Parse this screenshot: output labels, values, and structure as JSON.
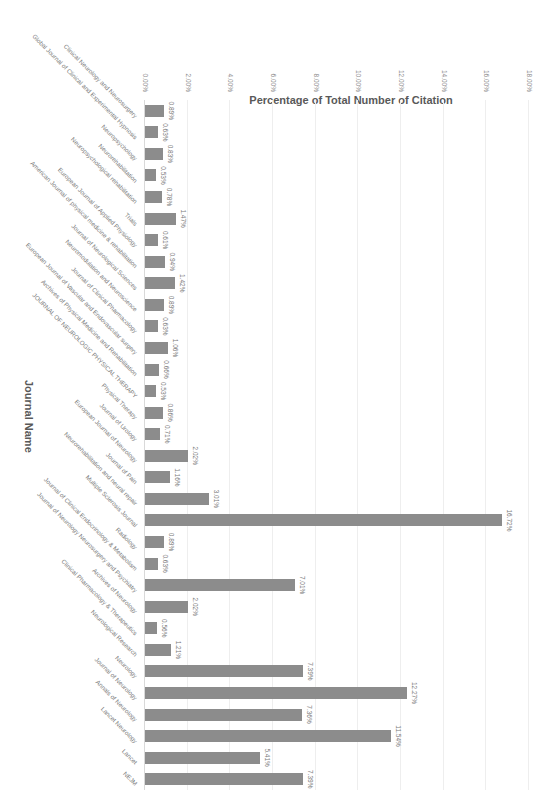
{
  "chart_data": {
    "type": "bar",
    "title": "",
    "xlabel": "Journal Name",
    "ylabel": "Percentage of Total Number of Citation",
    "ylim": [
      0,
      18
    ],
    "yticks": [
      "0.00%",
      "2.00%",
      "4.00%",
      "6.00%",
      "8.00%",
      "10.00%",
      "12.00%",
      "14.00%",
      "16.00%",
      "18.00%"
    ],
    "grid": true,
    "legend": null,
    "orientation_in_image": "rotated 90 degrees clockwise",
    "bar_color": "#8c8c8c",
    "categories": [
      "Clinical Neurology and Neurosurgery",
      "Global Journal of Clinical and Experimental Hypnosis",
      "Neuropsychology",
      "Neurorehabilitation",
      "Neuropsychological rehabilitation",
      "Trials",
      "European Journal of Applied Physiology",
      "American Journal of physical medicine & rehabilitation",
      "Journal of Neurological Sciences",
      "Neuromodulation and Neuroscience",
      "Journal of Clinical Pharmacology",
      "European Journal of Vascular and Endovascular surgery",
      "Archives of Physical Medicine and Rehabilitation",
      "JOURNAL OF NEUROLOGIC PHYSICAL THERAPY",
      "Physical Therapy",
      "Journal of Urology",
      "European Journal of Neurology",
      "Journal of Pain",
      "Neurorehabilitation and neural repair",
      "Multiple Sclerosis Journal",
      "Radiology",
      "Journal of Clinical Endocrinology & Metabolism",
      "Journal of Neurology Neurosurgery and Psychiatry",
      "Archives of Neurology",
      "Clinical Pharmacology & Therapeutics",
      "Neurological Research",
      "Neurology",
      "Journal of Neurology",
      "Annals of Neurology",
      "Lancet Neurology",
      "Lancet",
      "NEJM"
    ],
    "values": [
      0.89,
      0.63,
      0.83,
      0.53,
      0.78,
      1.47,
      0.61,
      0.94,
      1.42,
      0.89,
      0.63,
      1.06,
      0.66,
      0.53,
      0.86,
      0.71,
      2.02,
      1.16,
      3.01,
      16.72,
      0.89,
      0.63,
      7.01,
      2.02,
      0.56,
      1.21,
      7.39,
      12.27,
      7.36,
      11.54,
      5.41,
      7.39
    ],
    "value_labels": [
      "0.89%",
      "0.63%",
      "0.83%",
      "0.53%",
      "0.78%",
      "1.47%",
      "0.61%",
      "0.94%",
      "1.42%",
      "0.89%",
      "0.63%",
      "1.06%",
      "0.66%",
      "0.53%",
      "0.86%",
      "0.71%",
      "2.02%",
      "1.16%",
      "3.01%",
      "16.72%",
      "0.89%",
      "0.63%",
      "7.01%",
      "2.02%",
      "0.56%",
      "1.21%",
      "7.39%",
      "12.27%",
      "7.36%",
      "11.54%",
      "5.41%",
      "7.39%"
    ]
  }
}
